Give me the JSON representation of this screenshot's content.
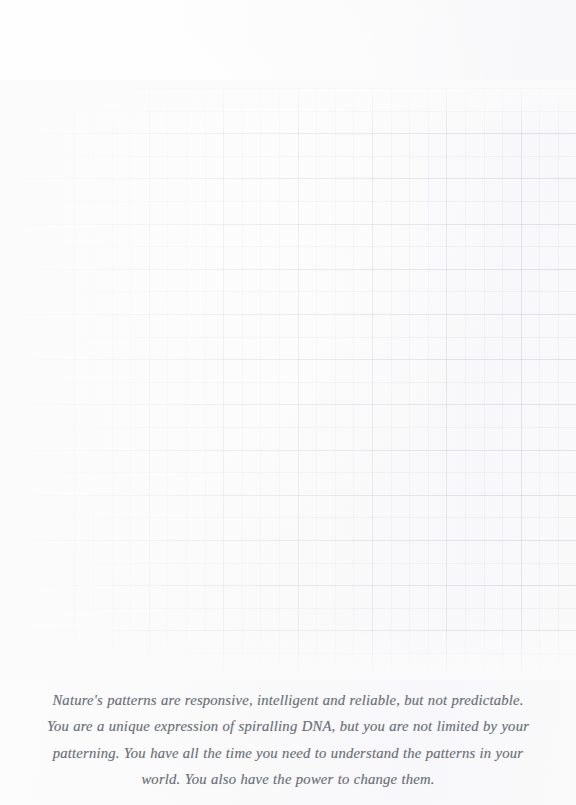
{
  "page": {
    "background_color": "#fbfbfc",
    "width": 576,
    "height": 805
  },
  "grid": {
    "name": "graph-paper-ruling",
    "line_color": "#6c768c",
    "visible": true,
    "top": 88,
    "bottom": 672,
    "minor_row_spacing_px": 22.6,
    "minor_column_spacing_px": 18.6,
    "major_row_spacing_px": 45.2,
    "major_column_spacing_px": 74.4,
    "stronger_side": "right"
  },
  "quote": {
    "text_color": "#6f727b",
    "style": "italic",
    "alignment": "center",
    "lines": [
      "Nature's patterns are responsive, intelligent and reliable, but not predictable.",
      "You are a unique expression of spiralling DNA, but you are not limited by your",
      "patterning. You have all the time you need to understand the patterns in your",
      "world. You also have the power to change them."
    ],
    "full_text": "Nature's patterns are responsive, intelligent and reliable, but not predictable. You are a unique expression of spiralling DNA, but you are not limited by your patterning. You have all the time you need to understand the patterns in your world. You also have the power to change them."
  }
}
